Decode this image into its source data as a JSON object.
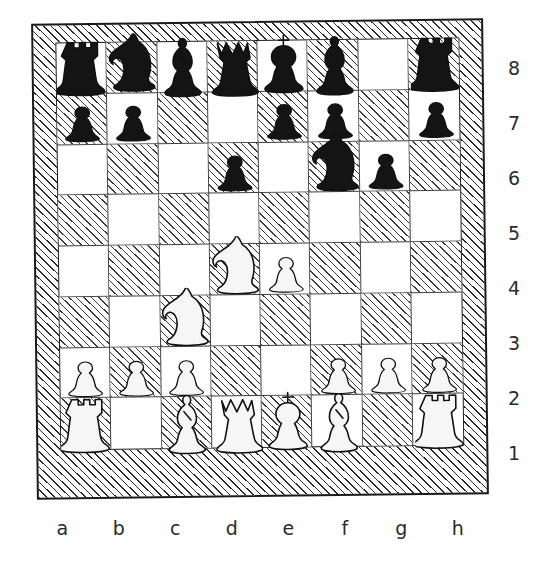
{
  "board": {
    "files": [
      "a",
      "b",
      "c",
      "d",
      "e",
      "f",
      "g",
      "h"
    ],
    "ranks": [
      "8",
      "7",
      "6",
      "5",
      "4",
      "3",
      "2",
      "1"
    ],
    "orientation": "white-bottom",
    "light_square_color": "#ffffff",
    "dark_square_color": "#3a3a3a",
    "border_style": "hatched",
    "dark_square_style": "diagonal-hatch"
  },
  "chart_data": {
    "type": "table",
    "notation": "fen",
    "fen": "rnbqkb1r/pp2pp1p/3p1np1/8/3NP3/2N5/PPP2PPP/R1BQKB1R",
    "squares": [
      {
        "square": "a8",
        "piece": "rook",
        "color": "black",
        "glyph": "♜"
      },
      {
        "square": "b8",
        "piece": "knight",
        "color": "black",
        "glyph": "♞"
      },
      {
        "square": "c8",
        "piece": "bishop",
        "color": "black",
        "glyph": "♝"
      },
      {
        "square": "d8",
        "piece": "queen",
        "color": "black",
        "glyph": "♛"
      },
      {
        "square": "e8",
        "piece": "king",
        "color": "black",
        "glyph": "♚"
      },
      {
        "square": "f8",
        "piece": "bishop",
        "color": "black",
        "glyph": "♝"
      },
      {
        "square": "g8",
        "piece": "empty",
        "color": "none",
        "glyph": ""
      },
      {
        "square": "h8",
        "piece": "rook",
        "color": "black",
        "glyph": "♜"
      },
      {
        "square": "a7",
        "piece": "pawn",
        "color": "black",
        "glyph": "♟"
      },
      {
        "square": "b7",
        "piece": "pawn",
        "color": "black",
        "glyph": "♟"
      },
      {
        "square": "c7",
        "piece": "empty",
        "color": "none",
        "glyph": ""
      },
      {
        "square": "d7",
        "piece": "empty",
        "color": "none",
        "glyph": ""
      },
      {
        "square": "e7",
        "piece": "pawn",
        "color": "black",
        "glyph": "♟"
      },
      {
        "square": "f7",
        "piece": "pawn",
        "color": "black",
        "glyph": "♟"
      },
      {
        "square": "g7",
        "piece": "empty",
        "color": "none",
        "glyph": ""
      },
      {
        "square": "h7",
        "piece": "pawn",
        "color": "black",
        "glyph": "♟"
      },
      {
        "square": "a6",
        "piece": "empty",
        "color": "none",
        "glyph": ""
      },
      {
        "square": "b6",
        "piece": "empty",
        "color": "none",
        "glyph": ""
      },
      {
        "square": "c6",
        "piece": "empty",
        "color": "none",
        "glyph": ""
      },
      {
        "square": "d6",
        "piece": "pawn",
        "color": "black",
        "glyph": "♟"
      },
      {
        "square": "e6",
        "piece": "empty",
        "color": "none",
        "glyph": ""
      },
      {
        "square": "f6",
        "piece": "knight",
        "color": "black",
        "glyph": "♞"
      },
      {
        "square": "g6",
        "piece": "pawn",
        "color": "black",
        "glyph": "♟"
      },
      {
        "square": "h6",
        "piece": "empty",
        "color": "none",
        "glyph": ""
      },
      {
        "square": "a5",
        "piece": "empty",
        "color": "none",
        "glyph": ""
      },
      {
        "square": "b5",
        "piece": "empty",
        "color": "none",
        "glyph": ""
      },
      {
        "square": "c5",
        "piece": "empty",
        "color": "none",
        "glyph": ""
      },
      {
        "square": "d5",
        "piece": "empty",
        "color": "none",
        "glyph": ""
      },
      {
        "square": "e5",
        "piece": "empty",
        "color": "none",
        "glyph": ""
      },
      {
        "square": "f5",
        "piece": "empty",
        "color": "none",
        "glyph": ""
      },
      {
        "square": "g5",
        "piece": "empty",
        "color": "none",
        "glyph": ""
      },
      {
        "square": "h5",
        "piece": "empty",
        "color": "none",
        "glyph": ""
      },
      {
        "square": "a4",
        "piece": "empty",
        "color": "none",
        "glyph": ""
      },
      {
        "square": "b4",
        "piece": "empty",
        "color": "none",
        "glyph": ""
      },
      {
        "square": "c4",
        "piece": "empty",
        "color": "none",
        "glyph": ""
      },
      {
        "square": "d4",
        "piece": "knight",
        "color": "white",
        "glyph": "♘"
      },
      {
        "square": "e4",
        "piece": "pawn",
        "color": "white",
        "glyph": "♙"
      },
      {
        "square": "f4",
        "piece": "empty",
        "color": "none",
        "glyph": ""
      },
      {
        "square": "g4",
        "piece": "empty",
        "color": "none",
        "glyph": ""
      },
      {
        "square": "h4",
        "piece": "empty",
        "color": "none",
        "glyph": ""
      },
      {
        "square": "a3",
        "piece": "empty",
        "color": "none",
        "glyph": ""
      },
      {
        "square": "b3",
        "piece": "empty",
        "color": "none",
        "glyph": ""
      },
      {
        "square": "c3",
        "piece": "knight",
        "color": "white",
        "glyph": "♘"
      },
      {
        "square": "d3",
        "piece": "empty",
        "color": "none",
        "glyph": ""
      },
      {
        "square": "e3",
        "piece": "empty",
        "color": "none",
        "glyph": ""
      },
      {
        "square": "f3",
        "piece": "empty",
        "color": "none",
        "glyph": ""
      },
      {
        "square": "g3",
        "piece": "empty",
        "color": "none",
        "glyph": ""
      },
      {
        "square": "h3",
        "piece": "empty",
        "color": "none",
        "glyph": ""
      },
      {
        "square": "a2",
        "piece": "pawn",
        "color": "white",
        "glyph": "♙"
      },
      {
        "square": "b2",
        "piece": "pawn",
        "color": "white",
        "glyph": "♙"
      },
      {
        "square": "c2",
        "piece": "pawn",
        "color": "white",
        "glyph": "♙"
      },
      {
        "square": "d2",
        "piece": "empty",
        "color": "none",
        "glyph": ""
      },
      {
        "square": "e2",
        "piece": "empty",
        "color": "none",
        "glyph": ""
      },
      {
        "square": "f2",
        "piece": "pawn",
        "color": "white",
        "glyph": "♙"
      },
      {
        "square": "g2",
        "piece": "pawn",
        "color": "white",
        "glyph": "♙"
      },
      {
        "square": "h2",
        "piece": "pawn",
        "color": "white",
        "glyph": "♙"
      },
      {
        "square": "a1",
        "piece": "rook",
        "color": "white",
        "glyph": "♖"
      },
      {
        "square": "b1",
        "piece": "empty",
        "color": "none",
        "glyph": ""
      },
      {
        "square": "c1",
        "piece": "bishop",
        "color": "white",
        "glyph": "♗"
      },
      {
        "square": "d1",
        "piece": "queen",
        "color": "white",
        "glyph": "♕"
      },
      {
        "square": "e1",
        "piece": "king",
        "color": "white",
        "glyph": "♔"
      },
      {
        "square": "f1",
        "piece": "bishop",
        "color": "white",
        "glyph": "♗"
      },
      {
        "square": "g1",
        "piece": "empty",
        "color": "none",
        "glyph": ""
      },
      {
        "square": "h1",
        "piece": "rook",
        "color": "white",
        "glyph": "♖"
      }
    ]
  }
}
